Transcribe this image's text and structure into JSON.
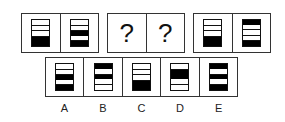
{
  "puzzle": {
    "top_row": [
      {
        "id": "group-1",
        "cells": [
          {
            "type": "icon",
            "segments": [
              "w",
              "w",
              "w",
              "B"
            ]
          },
          {
            "type": "icon",
            "segments": [
              "w",
              "w",
              "b",
              "w",
              "b"
            ]
          }
        ]
      },
      {
        "id": "group-2",
        "cells": [
          {
            "type": "question",
            "text": "?"
          },
          {
            "type": "question",
            "text": "?"
          }
        ]
      },
      {
        "id": "group-3",
        "cells": [
          {
            "type": "icon",
            "segments": [
              "w",
              "w",
              "w",
              "B"
            ]
          },
          {
            "type": "icon",
            "segments": [
              "b",
              "w",
              "w",
              "w",
              "b"
            ]
          }
        ]
      }
    ],
    "options": [
      {
        "label": "A",
        "segments": [
          "w",
          "w",
          "b",
          "w",
          "b"
        ]
      },
      {
        "label": "B",
        "segments": [
          "b",
          "w",
          "b",
          "w",
          "w"
        ]
      },
      {
        "label": "C",
        "segments": [
          "w",
          "w",
          "w",
          "B"
        ]
      },
      {
        "label": "D",
        "segments": [
          "w",
          "B",
          "w",
          "w"
        ]
      },
      {
        "label": "E",
        "segments": [
          "b",
          "w",
          "b",
          "w",
          "b"
        ]
      }
    ]
  },
  "colors": {
    "line": "#333333",
    "fill": "#000000",
    "background": "#ffffff"
  }
}
